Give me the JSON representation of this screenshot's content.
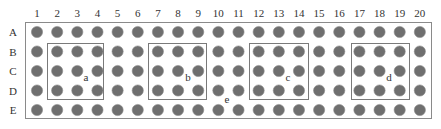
{
  "diagram": {
    "type": "well-plate-grid",
    "columns": [
      "1",
      "2",
      "3",
      "4",
      "5",
      "6",
      "7",
      "8",
      "9",
      "10",
      "11",
      "12",
      "13",
      "14",
      "15",
      "16",
      "17",
      "18",
      "19",
      "20"
    ],
    "rows": [
      "A",
      "B",
      "C",
      "D",
      "E"
    ],
    "colors": {
      "dot": "#6f6f6f",
      "frame": "#8a8a8a",
      "box": "#7a7a7a",
      "text": "#333333"
    },
    "boxes": [
      {
        "label": "a",
        "columns": [
          "2",
          "3",
          "4"
        ],
        "rows": [
          "B",
          "C",
          "D"
        ]
      },
      {
        "label": "b",
        "columns": [
          "7",
          "8",
          "9"
        ],
        "rows": [
          "B",
          "C",
          "D"
        ]
      },
      {
        "label": "c",
        "columns": [
          "12",
          "13",
          "14"
        ],
        "rows": [
          "B",
          "C",
          "D"
        ]
      },
      {
        "label": "d",
        "columns": [
          "17",
          "18",
          "19"
        ],
        "rows": [
          "B",
          "C",
          "D"
        ]
      }
    ],
    "extra_labels": [
      {
        "label": "e",
        "near": "between D10-E11"
      }
    ]
  }
}
